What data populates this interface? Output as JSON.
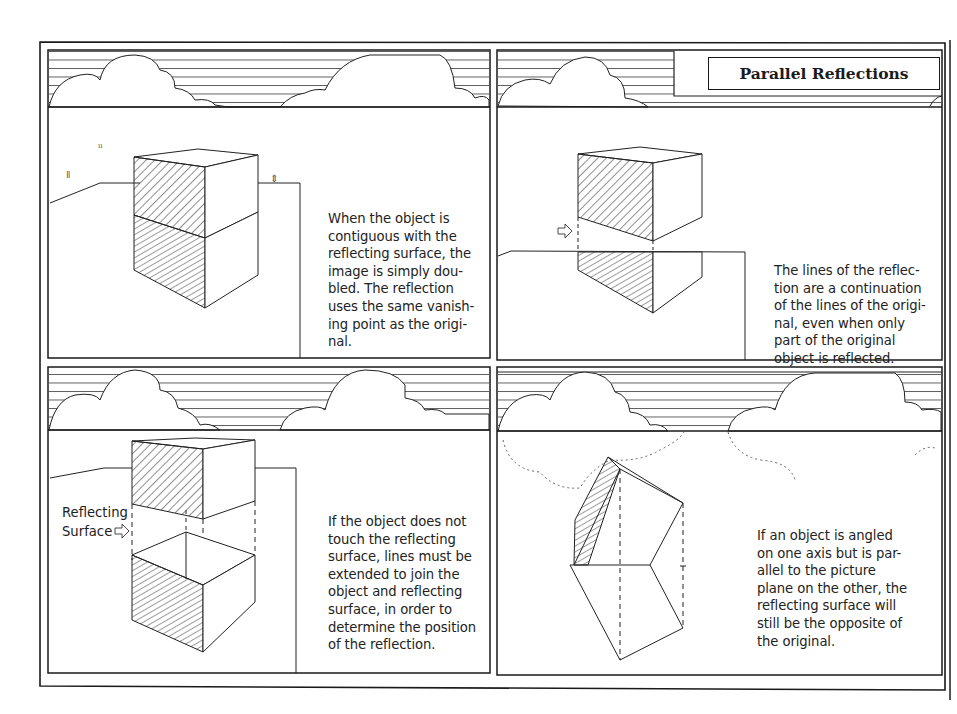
{
  "page": {
    "title": "Parallel Reflections"
  },
  "panels": [
    {
      "id": "top-left",
      "caption": "When the object is\ncontiguous with the\nreflecting surface, the\nimage is simply dou-\nbled. The reflection\nuses the same vanish-\ning point as the origi-\nnal."
    },
    {
      "id": "top-right",
      "caption": "The lines of the reflec-\ntion are a continuation\nof the lines of the origi-\nnal, even when only\npart of the original\nobject is reflected."
    },
    {
      "id": "bottom-left",
      "caption": "If the object does not\ntouch the reflecting\nsurface, lines must be\nextended to join the\nobject and reflecting\nsurface, in order to\ndetermine the position\nof the reflection.",
      "label": "Reflecting\nSurface"
    },
    {
      "id": "bottom-right",
      "caption": "If an object is angled\non one axis but is par-\nallel to the picture\nplane on the other, the\nreflecting surface will\nstill be the opposite of\nthe original."
    }
  ],
  "colors": {
    "ink": "#1a1a1a",
    "paper": "#ffffff"
  }
}
